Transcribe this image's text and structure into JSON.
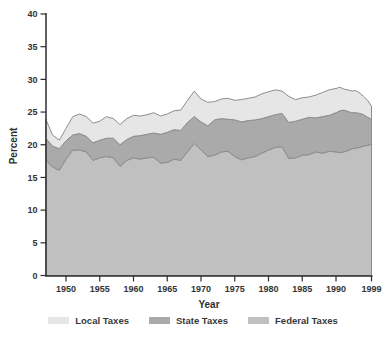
{
  "chart_data": {
    "type": "area",
    "stacked": true,
    "title": "",
    "xlabel": "Year",
    "ylabel": "Percent",
    "ylim": [
      0,
      40
    ],
    "grid": false,
    "legend_position": "bottom",
    "y_ticks": [
      0,
      5,
      10,
      15,
      20,
      25,
      30,
      35,
      40
    ],
    "x_tick_years": [
      1950,
      1955,
      1960,
      1965,
      1970,
      1975,
      1980,
      1985,
      1990,
      1999
    ],
    "years": [
      1947,
      1948,
      1949,
      1950,
      1951,
      1952,
      1953,
      1954,
      1955,
      1956,
      1957,
      1958,
      1959,
      1960,
      1961,
      1962,
      1963,
      1964,
      1965,
      1966,
      1967,
      1968,
      1969,
      1970,
      1971,
      1972,
      1973,
      1974,
      1975,
      1976,
      1977,
      1978,
      1979,
      1980,
      1981,
      1982,
      1983,
      1984,
      1985,
      1986,
      1987,
      1988,
      1989,
      1990,
      1991,
      1992,
      1993,
      1994,
      1995,
      1996,
      1997,
      1998,
      1999
    ],
    "series": [
      {
        "name": "Federal Taxes",
        "color": "#c0c0c0",
        "values": [
          17.7,
          16.6,
          16.1,
          17.8,
          19.2,
          19.2,
          18.9,
          17.6,
          18.0,
          18.2,
          18.0,
          16.7,
          17.6,
          18.0,
          17.8,
          18.0,
          18.1,
          17.2,
          17.3,
          17.8,
          17.6,
          18.9,
          20.2,
          19.2,
          18.2,
          18.4,
          18.9,
          19.0,
          18.2,
          17.7,
          18.0,
          18.2,
          18.7,
          19.2,
          19.6,
          19.7,
          17.9,
          18.0,
          18.4,
          18.5,
          18.9,
          18.7,
          19.0,
          18.9,
          18.8,
          18.9,
          19.1,
          19.4,
          19.5,
          19.6,
          19.8,
          19.9,
          20.1
        ]
      },
      {
        "name": "State Taxes",
        "color": "#aaaaaa",
        "values": [
          3.3,
          3.2,
          3.3,
          2.8,
          2.3,
          2.5,
          2.4,
          2.7,
          2.7,
          2.8,
          3.0,
          3.3,
          3.2,
          3.3,
          3.6,
          3.6,
          3.7,
          4.4,
          4.6,
          4.5,
          4.6,
          4.5,
          4.1,
          4.3,
          4.7,
          5.4,
          5.1,
          4.9,
          5.6,
          5.8,
          5.7,
          5.6,
          5.3,
          5.1,
          5.0,
          5.1,
          5.5,
          5.6,
          5.5,
          5.7,
          5.2,
          5.6,
          5.5,
          6.0,
          6.4,
          6.4,
          6.0,
          5.5,
          5.4,
          5.2,
          4.8,
          4.3,
          3.8
        ]
      },
      {
        "name": "Local Taxes",
        "color": "#e6e6e6",
        "values": [
          2.9,
          1.7,
          1.3,
          1.9,
          2.8,
          3.0,
          3.0,
          3.0,
          2.9,
          3.3,
          3.0,
          3.1,
          3.2,
          3.2,
          3.0,
          3.0,
          3.1,
          2.8,
          2.8,
          2.9,
          3.1,
          3.4,
          3.9,
          3.5,
          3.6,
          2.8,
          3.0,
          3.2,
          3.0,
          3.4,
          3.4,
          3.5,
          3.8,
          3.8,
          3.8,
          3.4,
          4.0,
          3.3,
          3.3,
          3.1,
          3.5,
          3.7,
          3.9,
          3.7,
          3.6,
          3.2,
          3.3,
          3.3,
          3.4,
          3.1,
          2.8,
          2.6,
          2.0
        ]
      }
    ]
  },
  "axis": {
    "x_title": "Year",
    "y_title": "Percent"
  },
  "legend": {
    "items": [
      {
        "label": "Local Taxes",
        "color": "#e6e6e6"
      },
      {
        "label": "State Taxes",
        "color": "#aaaaaa"
      },
      {
        "label": "Federal Taxes",
        "color": "#c0c0c0"
      }
    ]
  },
  "colors": {
    "stroke": "#8d8d8d",
    "axis": "#2d2d2d",
    "text": "#343434",
    "background": "#ffffff"
  }
}
